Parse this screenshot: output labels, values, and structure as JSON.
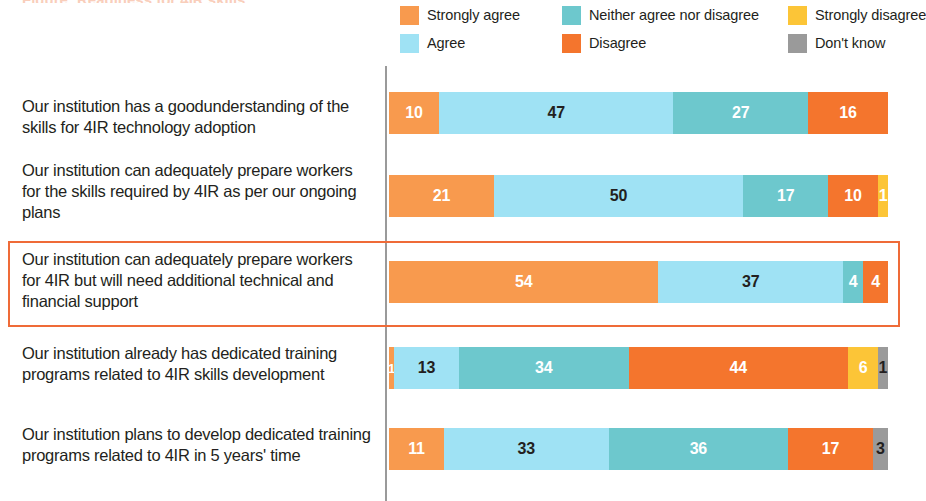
{
  "title_sliver": "Figure: Readiness for 4IR skills",
  "legend": {
    "items": [
      {
        "label": "Strongly agree",
        "color": "#f89a4e",
        "x": 0,
        "y": 0
      },
      {
        "label": "Neither agree nor disagree",
        "color": "#6dc8cd",
        "x": 162,
        "y": 0
      },
      {
        "label": "Strongly disagree",
        "color": "#fcc537",
        "x": 388,
        "y": 0
      },
      {
        "label": "Agree",
        "color": "#9fe2f4",
        "x": 0,
        "y": 28
      },
      {
        "label": "Disagree",
        "color": "#f4752d",
        "x": 162,
        "y": 28
      },
      {
        "label": "Don't know",
        "color": "#9a9a9a",
        "x": 388,
        "y": 28
      }
    ]
  },
  "colors": {
    "strongly_agree": "#f89a4e",
    "agree": "#9fe2f4",
    "neither": "#6dc8cd",
    "disagree": "#f4752d",
    "strongly_disagree": "#fcc537",
    "dont_know": "#9a9a9a",
    "highlight_border": "#ef6b38",
    "axis": "#9a9a9a",
    "text": "#231f20"
  },
  "chart_data": {
    "type": "bar",
    "title": "",
    "xlabel": "",
    "ylabel": "",
    "xlim": [
      0,
      100
    ],
    "grid": false,
    "orientation": "horizontal",
    "stacked": true,
    "stack_normalized": true,
    "legend_position": "top-right",
    "categories": [
      "Our institution has a goodunderstanding of the skills for 4IR technology adoption",
      "Our institution can adequately prepare workers for the skills required by 4IR as per our ongoing plans",
      "Our institution can adequately prepare workers for 4IR but will need additional technical and financial support",
      "Our institution already has dedicated training programs related to 4IR skills development",
      "Our institution plans to develop dedicated training programs related to 4IR in 5 years' time"
    ],
    "series": [
      {
        "name": "Strongly agree",
        "color": "#f89a4e",
        "values": [
          10,
          21,
          54,
          1,
          11
        ]
      },
      {
        "name": "Agree",
        "color": "#9fe2f4",
        "values": [
          47,
          50,
          37,
          13,
          33
        ]
      },
      {
        "name": "Neither agree nor disagree",
        "color": "#6dc8cd",
        "values": [
          27,
          17,
          4,
          34,
          36
        ]
      },
      {
        "name": "Disagree",
        "color": "#f4752d",
        "values": [
          16,
          10,
          4,
          44,
          17
        ]
      },
      {
        "name": "Strongly disagree",
        "color": "#fcc537",
        "values": [
          0,
          1,
          0,
          6,
          0
        ]
      },
      {
        "name": "Don't know",
        "color": "#9a9a9a",
        "values": [
          0,
          0,
          0,
          1,
          3
        ]
      }
    ]
  },
  "rows": [
    {
      "label": "Our institution has a goodunderstanding of the skills for 4IR technology adoption",
      "label_top": 96,
      "bar_top": 92,
      "segments": [
        {
          "key": "strongly_agree",
          "value": 10,
          "text": "10",
          "color": "#f89a4e",
          "text_color": "light"
        },
        {
          "key": "agree",
          "value": 47,
          "text": "47",
          "color": "#9fe2f4",
          "text_color": "dark"
        },
        {
          "key": "neither",
          "value": 27,
          "text": "27",
          "color": "#6dc8cd",
          "text_color": "light"
        },
        {
          "key": "disagree",
          "value": 16,
          "text": "16",
          "color": "#f4752d",
          "text_color": "light"
        }
      ]
    },
    {
      "label": "Our institution can adequately prepare workers for the skills required by 4IR as per our ongoing plans",
      "label_top": 160,
      "bar_top": 175,
      "segments": [
        {
          "key": "strongly_agree",
          "value": 21,
          "text": "21",
          "color": "#f89a4e",
          "text_color": "light"
        },
        {
          "key": "agree",
          "value": 50,
          "text": "50",
          "color": "#9fe2f4",
          "text_color": "dark"
        },
        {
          "key": "neither",
          "value": 17,
          "text": "17",
          "color": "#6dc8cd",
          "text_color": "light"
        },
        {
          "key": "disagree",
          "value": 10,
          "text": "10",
          "color": "#f4752d",
          "text_color": "light"
        },
        {
          "key": "strongly_disagree",
          "value": 2,
          "text": "1",
          "color": "#fcc537",
          "text_color": "light"
        }
      ]
    },
    {
      "label": "Our institution can adequately prepare workers for 4IR but will need additional technical and financial support",
      "label_top": 249,
      "bar_top": 261,
      "segments": [
        {
          "key": "strongly_agree",
          "value": 54,
          "text": "54",
          "color": "#f89a4e",
          "text_color": "light"
        },
        {
          "key": "agree",
          "value": 37,
          "text": "37",
          "color": "#9fe2f4",
          "text_color": "dark"
        },
        {
          "key": "neither",
          "value": 4,
          "text": "4",
          "color": "#6dc8cd",
          "text_color": "light"
        },
        {
          "key": "disagree",
          "value": 5,
          "text": "4",
          "color": "#f4752d",
          "text_color": "light"
        }
      ]
    },
    {
      "label": "Our institution already has dedicated training programs related to 4IR skills development",
      "label_top": 343,
      "bar_top": 347,
      "segments": [
        {
          "key": "strongly_agree",
          "value": 1,
          "text": "1",
          "color": "#f89a4e",
          "text_color": "light"
        },
        {
          "key": "agree",
          "value": 13,
          "text": "13",
          "color": "#9fe2f4",
          "text_color": "dark"
        },
        {
          "key": "neither",
          "value": 34,
          "text": "34",
          "color": "#6dc8cd",
          "text_color": "light"
        },
        {
          "key": "disagree",
          "value": 44,
          "text": "44",
          "color": "#f4752d",
          "text_color": "light"
        },
        {
          "key": "strongly_disagree",
          "value": 6,
          "text": "6",
          "color": "#fcc537",
          "text_color": "light"
        },
        {
          "key": "dont_know",
          "value": 2,
          "text": "1",
          "color": "#9a9a9a",
          "text_color": "dark"
        }
      ]
    },
    {
      "label": "Our institution plans to develop dedicated training programs related to 4IR in 5 years' time",
      "label_top": 424,
      "bar_top": 428,
      "segments": [
        {
          "key": "strongly_agree",
          "value": 11,
          "text": "11",
          "color": "#f89a4e",
          "text_color": "light"
        },
        {
          "key": "agree",
          "value": 33,
          "text": "33",
          "color": "#9fe2f4",
          "text_color": "dark"
        },
        {
          "key": "neither",
          "value": 36,
          "text": "36",
          "color": "#6dc8cd",
          "text_color": "light"
        },
        {
          "key": "disagree",
          "value": 17,
          "text": "17",
          "color": "#f4752d",
          "text_color": "light"
        },
        {
          "key": "dont_know",
          "value": 3,
          "text": "3",
          "color": "#9a9a9a",
          "text_color": "dark"
        }
      ]
    }
  ],
  "highlight": {
    "row_index": 2,
    "border_color": "#ef6b38"
  }
}
